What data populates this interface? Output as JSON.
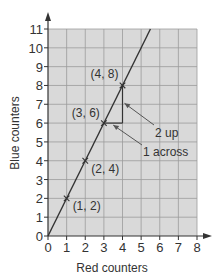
{
  "chart_data": {
    "type": "line",
    "title": "",
    "xlabel": "Red counters",
    "ylabel": "Blue counters",
    "xlim": [
      0,
      8
    ],
    "ylim": [
      0,
      11
    ],
    "x_ticks": [
      "0",
      "1",
      "2",
      "3",
      "4",
      "5",
      "6",
      "7",
      "8"
    ],
    "y_ticks": [
      "0",
      "1",
      "2",
      "3",
      "4",
      "5",
      "6",
      "7",
      "8",
      "9",
      "10",
      "11"
    ],
    "grid": true,
    "legend": null,
    "series": [
      {
        "name": "y = 2x",
        "line": {
          "x": [
            0,
            5.5
          ],
          "y": [
            0,
            11
          ]
        },
        "points": [
          {
            "x": 1,
            "y": 2,
            "label": "(1, 2)"
          },
          {
            "x": 2,
            "y": 4,
            "label": "(2, 4)"
          },
          {
            "x": 3,
            "y": 6,
            "label": "(3, 6)"
          },
          {
            "x": 4,
            "y": 8,
            "label": "(4, 8)"
          }
        ]
      }
    ],
    "annotations": [
      {
        "text": "2 up",
        "target": "vertical step from (4,6) to (4,8)"
      },
      {
        "text": "1 across",
        "target": "horizontal step from (3,6) to (4,6)"
      }
    ]
  },
  "colors": {
    "grid_fill": "#d9d9d9",
    "grid_line": "#9c9c9c",
    "axis": "#333333",
    "line": "#333333",
    "text": "#333333"
  }
}
